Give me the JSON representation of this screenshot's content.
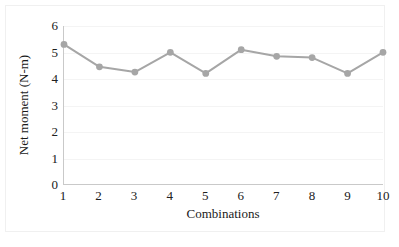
{
  "chart_data": {
    "type": "line",
    "title": "",
    "xlabel": "Combinations",
    "ylabel": "Net moment (N-m)",
    "categories": [
      "1",
      "2",
      "3",
      "4",
      "5",
      "6",
      "7",
      "8",
      "9",
      "10"
    ],
    "x": [
      1,
      2,
      3,
      4,
      5,
      6,
      7,
      8,
      9,
      10
    ],
    "values": [
      5.3,
      4.45,
      4.25,
      5.0,
      4.2,
      5.1,
      4.85,
      4.8,
      4.2,
      5.0
    ],
    "series": [
      {
        "name": "Net moment",
        "values": [
          5.3,
          4.45,
          4.25,
          5.0,
          4.2,
          5.1,
          4.85,
          4.8,
          4.2,
          5.0
        ]
      }
    ],
    "ylim": [
      0,
      6
    ],
    "xlim": [
      1,
      10
    ],
    "y_ticks": [
      0,
      1,
      2,
      3,
      4,
      5,
      6
    ],
    "y_tick_labels": [
      "0",
      "1",
      "2",
      "3",
      "4",
      "5",
      "6"
    ],
    "x_ticks": [
      1,
      2,
      3,
      4,
      5,
      6,
      7,
      8,
      9,
      10
    ],
    "x_tick_labels": [
      "1",
      "2",
      "3",
      "4",
      "5",
      "6",
      "7",
      "8",
      "9",
      "10"
    ],
    "grid": true,
    "grid_axis": "y",
    "legend": false,
    "legend_position": "none",
    "marker": "circle",
    "colors": {
      "series_line": "#a6a6a6",
      "marker": "#a6a6a6",
      "axis": "#c9c9c9",
      "gridline": "#f4f4f4",
      "text": "#1a1a1a",
      "frame_border": "#f0f0f0",
      "background": "#ffffff"
    }
  }
}
